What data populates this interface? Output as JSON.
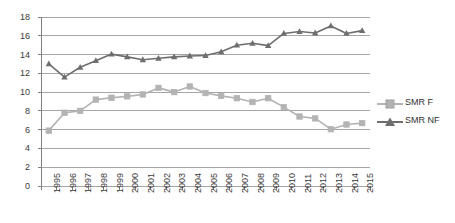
{
  "chart_data": {
    "type": "line",
    "title": "",
    "xlabel": "",
    "ylabel": "",
    "grid": true,
    "legend_position": "right",
    "ylim": [
      0,
      18
    ],
    "yticks": [
      0,
      2,
      4,
      6,
      8,
      10,
      12,
      14,
      16,
      18
    ],
    "categories": [
      "1995",
      "1996",
      "1997",
      "1998",
      "1999",
      "2000",
      "2001",
      "2002",
      "2003",
      "2004",
      "2005",
      "2006",
      "2007",
      "2008",
      "2009",
      "2010",
      "2011",
      "2012",
      "2013",
      "2014",
      "2015"
    ],
    "series": [
      {
        "name": "SMR F",
        "color": "#b3b3b3",
        "marker": "square",
        "values": [
          5.9,
          7.8,
          8.0,
          9.2,
          9.4,
          9.55,
          9.75,
          10.45,
          10.0,
          10.6,
          9.9,
          9.6,
          9.35,
          8.95,
          9.35,
          8.4,
          7.4,
          7.2,
          6.05,
          6.55,
          6.7
        ]
      },
      {
        "name": "SMR NF",
        "color": "#6e6e6e",
        "marker": "triangle",
        "values": [
          13.0,
          11.6,
          12.65,
          13.35,
          14.05,
          13.75,
          13.45,
          13.6,
          13.75,
          13.85,
          13.9,
          14.3,
          15.0,
          15.2,
          14.95,
          16.25,
          16.45,
          16.3,
          17.05,
          16.25,
          16.55
        ]
      }
    ]
  },
  "legend": {
    "items": [
      {
        "label": "SMR F"
      },
      {
        "label": "SMR NF"
      }
    ]
  },
  "axes": {
    "y_tick_labels": [
      "18",
      "16",
      "14",
      "12",
      "10",
      "8",
      "6",
      "4",
      "2",
      "0"
    ],
    "x_tick_labels": [
      "1995",
      "1996",
      "1997",
      "1998",
      "1999",
      "2000",
      "2001",
      "2002",
      "2003",
      "2004",
      "2005",
      "2006",
      "2007",
      "2008",
      "2009",
      "2010",
      "2011",
      "2012",
      "2013",
      "2014",
      "2015"
    ]
  },
  "colors": {
    "series_f": "#b3b3b3",
    "series_nf": "#6e6e6e",
    "gridline": "#a6a6a6",
    "axis": "#808080",
    "text": "#3a3a3a",
    "background": "#ffffff"
  }
}
